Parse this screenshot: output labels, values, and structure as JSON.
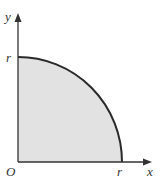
{
  "diagram": {
    "type": "quarter-circle region",
    "fill_color": "#e2e2e2",
    "curve_color": "#2a2a2a",
    "axis_color": "#333333",
    "labels": {
      "x_axis": "x",
      "y_axis": "y",
      "origin": "O",
      "x_intercept": "r",
      "y_intercept": "r"
    }
  }
}
